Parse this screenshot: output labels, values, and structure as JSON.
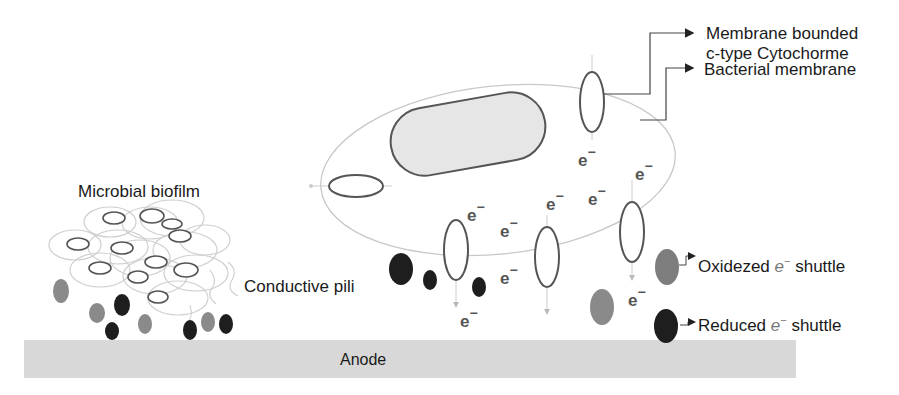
{
  "labels": {
    "cytochrome_line1": "Membrane bounded",
    "cytochrome_line2": "c-type Cytochorme",
    "membrane": "Bacterial membrane",
    "biofilm": "Microbial biofilm",
    "pili": "Conductive pili",
    "oxidized_prefix": "Oxidezed ",
    "oxidized_e": "e",
    "oxidized_suffix": " shuttle",
    "reduced_prefix": "Reduced ",
    "reduced_e": "e",
    "reduced_suffix": " shuttle",
    "anode": "Anode",
    "electron": "e",
    "electron_sup": "−"
  },
  "colors": {
    "anode": "#d8d8d8",
    "nucleoid_fill": "#e6e6e6",
    "outline": "#555555",
    "oxidized": "#8a8a8a",
    "reduced": "#1e1e1e"
  }
}
